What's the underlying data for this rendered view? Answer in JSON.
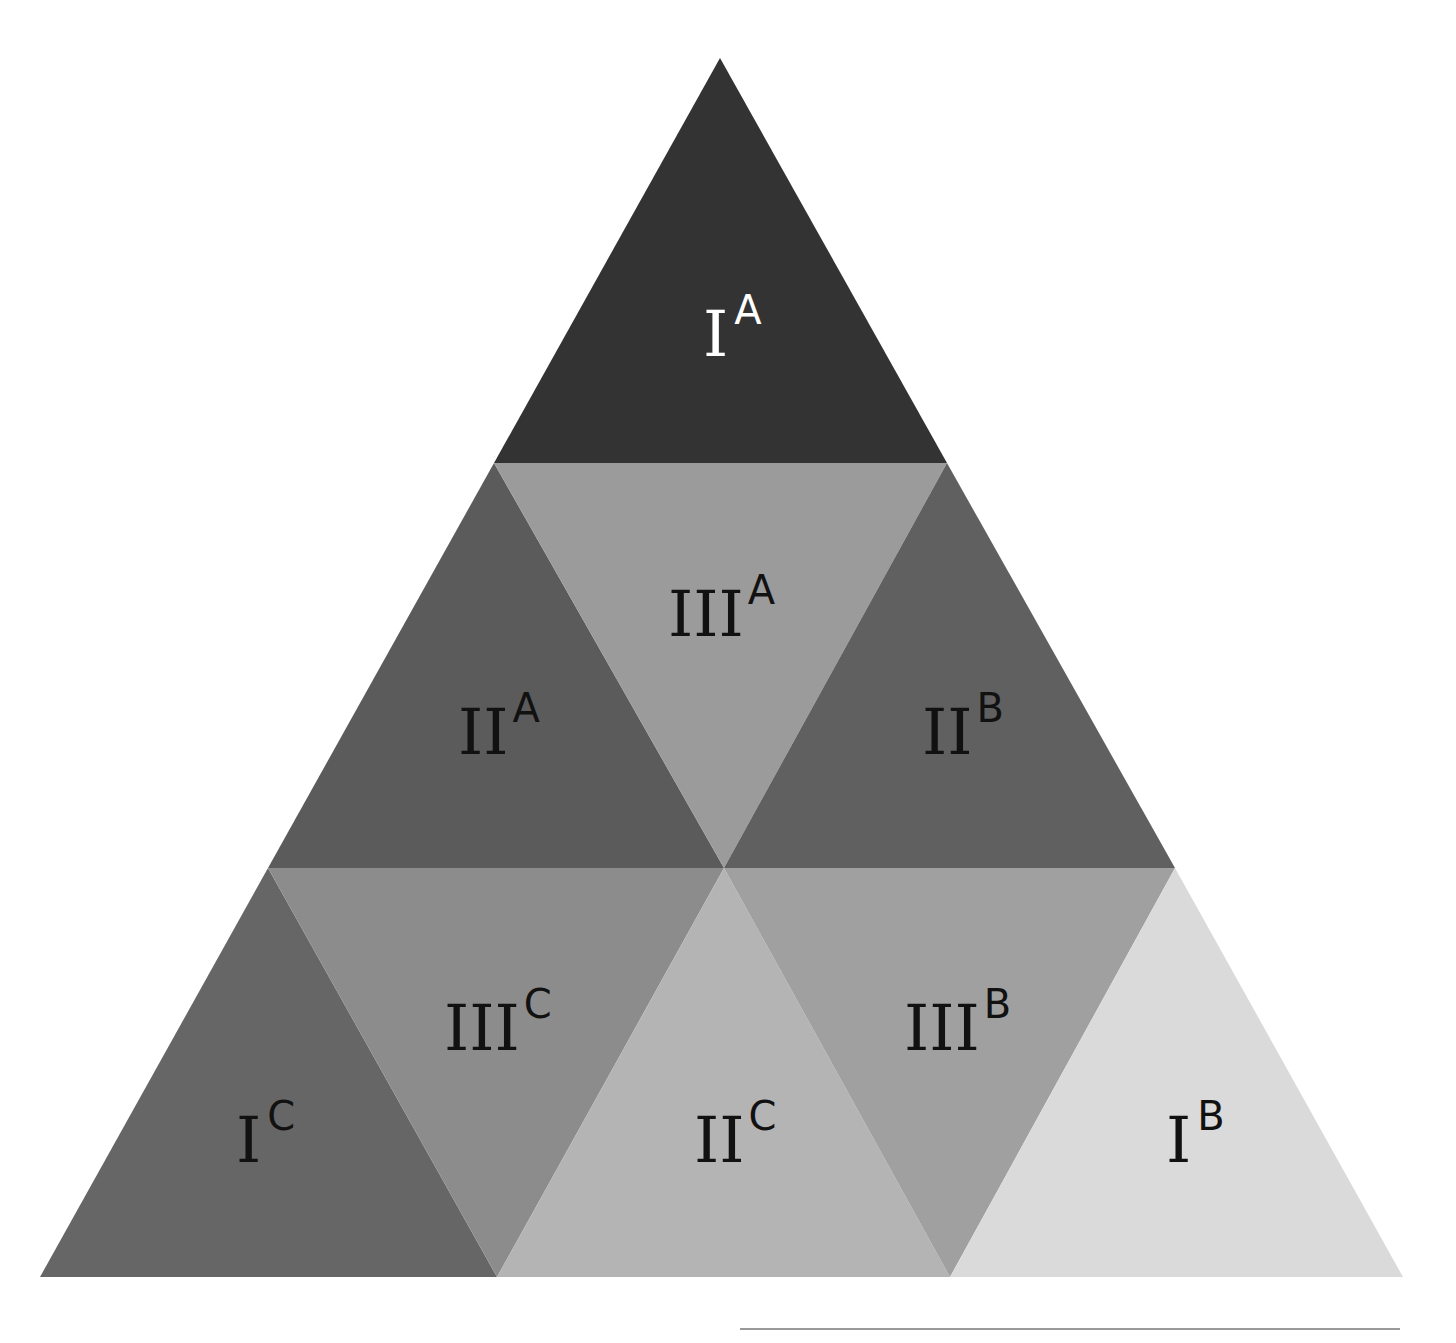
{
  "diagram": {
    "title": "",
    "regions": [
      {
        "id": "IA",
        "numeral": "III_placeholder",
        "main": "I",
        "sup": "A",
        "fill": "#333333",
        "text_color": "#ffffff"
      },
      {
        "id": "IIA",
        "main": "II",
        "sup": "A",
        "fill": "#5b5b5b",
        "text_color": "#111111"
      },
      {
        "id": "IIIA",
        "main": "III",
        "sup": "A",
        "fill": "#9b9b9b",
        "text_color": "#111111"
      },
      {
        "id": "IIB",
        "main": "II",
        "sup": "B",
        "fill": "#606060",
        "text_color": "#111111"
      },
      {
        "id": "IC",
        "main": "I",
        "sup": "C",
        "fill": "#666666",
        "text_color": "#111111"
      },
      {
        "id": "IIIC",
        "main": "III",
        "sup": "C",
        "fill": "#8c8c8c",
        "text_color": "#111111"
      },
      {
        "id": "IIC",
        "main": "II",
        "sup": "C",
        "fill": "#b4b4b4",
        "text_color": "#111111"
      },
      {
        "id": "IIIB",
        "main": "III",
        "sup": "B",
        "fill": "#a0a0a0",
        "text_color": "#111111"
      },
      {
        "id": "IB",
        "main": "I",
        "sup": "B",
        "fill": "#dadada",
        "text_color": "#111111"
      }
    ],
    "rule_color": "#999999"
  }
}
